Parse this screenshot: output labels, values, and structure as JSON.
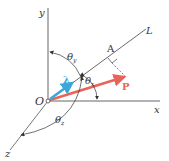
{
  "diagram": {
    "type": "vector-projection",
    "labels": {
      "y_axis": "y",
      "x_axis": "x",
      "z_axis": "z",
      "origin": "O",
      "line": "L",
      "point_a": "A",
      "vector_p": "P",
      "unit_vector": "λ",
      "theta_x": "θ",
      "theta_x_sub": "x",
      "theta_y": "θ",
      "theta_y_sub": "y",
      "theta_z": "θ",
      "theta_z_sub": "z"
    },
    "colors": {
      "axis": "#555555",
      "vector_p": "#e8645a",
      "unit_vector": "#3aa6dc",
      "text": "#333333"
    }
  }
}
